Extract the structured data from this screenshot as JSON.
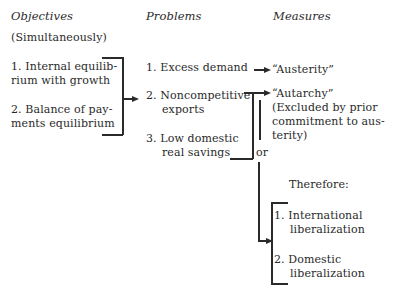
{
  "headers": {
    "objectives": "Objectives",
    "problems": "Problems",
    "measures": "Measures"
  },
  "objectives": {
    "qualifier": "(Simultaneously)",
    "items": [
      {
        "line1": "1.  Internal equilib-",
        "line2": "rium with growth"
      },
      {
        "line1": "2.  Balance of pay-",
        "line2": "ments equilibrium"
      }
    ]
  },
  "problems": {
    "items": [
      {
        "line1": "1.  Excess demand",
        "line2": ""
      },
      {
        "line1": "2.  Noncompetitive",
        "line2": "exports"
      },
      {
        "line1": "3.  Low domestic",
        "line2": "real savings"
      }
    ]
  },
  "measures": {
    "austerity": "“Austerity”",
    "autarchy": {
      "label": "“Autarchy”",
      "note_line1": "(Excluded by prior",
      "note_line2": "commitment to aus-",
      "note_line3": "terity)"
    },
    "or_label": "or",
    "therefore": "Therefore:",
    "liberalization": [
      {
        "line1": "1.  International",
        "line2": "liberalization"
      },
      {
        "line1": "2.  Domestic",
        "line2": "liberalization"
      }
    ]
  }
}
